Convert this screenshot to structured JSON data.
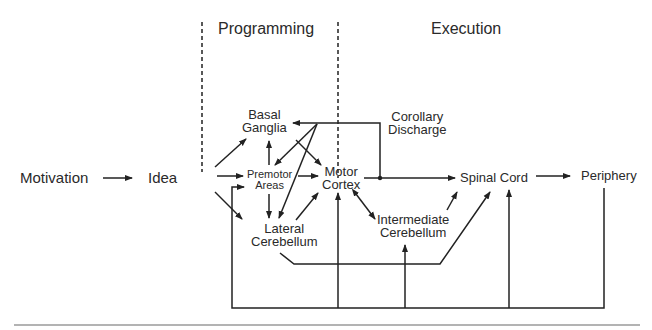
{
  "diagram": {
    "title_regions": {
      "programming": "Programming",
      "execution": "Execution"
    },
    "nodes": {
      "motivation": "Motivation",
      "idea": "Idea",
      "basal_ganglia": [
        "Basal",
        "Ganglia"
      ],
      "premotor_areas": [
        "Premotor",
        "Areas"
      ],
      "lateral_cerebellum": [
        "Lateral",
        "Cerebellum"
      ],
      "motor_cortex": [
        "Motor",
        "Cortex"
      ],
      "corollary_discharge": [
        "Corollary",
        "Discharge"
      ],
      "intermediate_cerebellum": [
        "Intermediate",
        "Cerebellum"
      ],
      "spinal_cord": "Spinal Cord",
      "periphery": "Periphery"
    },
    "edges": [
      {
        "from": "Motivation",
        "to": "Idea"
      },
      {
        "from": "Idea",
        "to": "Basal Ganglia"
      },
      {
        "from": "Idea",
        "to": "Premotor Areas"
      },
      {
        "from": "Idea",
        "to": "Lateral Cerebellum"
      },
      {
        "from": "Premotor Areas",
        "to": "Basal Ganglia"
      },
      {
        "from": "Premotor Areas",
        "to": "Lateral Cerebellum"
      },
      {
        "from": "Premotor Areas",
        "to": "Motor Cortex"
      },
      {
        "from": "Basal Ganglia",
        "to": "Motor Cortex"
      },
      {
        "from": "Lateral Cerebellum",
        "to": "Motor Cortex"
      },
      {
        "from": "Motor Cortex",
        "to": "Basal Ganglia",
        "via": "Corollary Discharge"
      },
      {
        "from": "Motor Cortex",
        "to": "Premotor Areas",
        "via": "Corollary Discharge"
      },
      {
        "from": "Motor Cortex",
        "to": "Lateral Cerebellum",
        "via": "Corollary Discharge"
      },
      {
        "from": "Motor Cortex",
        "to": "Spinal Cord"
      },
      {
        "from": "Motor Cortex",
        "to": "Intermediate Cerebellum",
        "bidirectional": true
      },
      {
        "from": "Intermediate Cerebellum",
        "to": "Spinal Cord"
      },
      {
        "from": "Lateral Cerebellum",
        "to": "Spinal Cord"
      },
      {
        "from": "Spinal Cord",
        "to": "Periphery"
      },
      {
        "from": "Periphery",
        "to": "feedback loop",
        "targets": [
          "Premotor Areas",
          "Motor Cortex",
          "Intermediate Cerebellum",
          "Spinal Cord"
        ]
      }
    ],
    "colors": {
      "line": "#222222",
      "text": "#2a2a2a",
      "rule": "#9a9a9a"
    }
  }
}
